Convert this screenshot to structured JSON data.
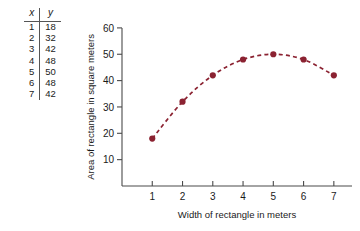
{
  "table": {
    "headers": [
      "x",
      "y"
    ],
    "rows": [
      {
        "x": "1",
        "y": "18"
      },
      {
        "x": "2",
        "y": "32"
      },
      {
        "x": "3",
        "y": "42"
      },
      {
        "x": "4",
        "y": "48"
      },
      {
        "x": "5",
        "y": "50"
      },
      {
        "x": "6",
        "y": "48"
      },
      {
        "x": "7",
        "y": "42"
      }
    ]
  },
  "chart_data": {
    "type": "scatter",
    "title": "",
    "xlabel": "Width of rectangle in meters",
    "ylabel": "Area of rectangle in square meters",
    "x": [
      1,
      2,
      3,
      4,
      5,
      6,
      7
    ],
    "values": [
      18,
      32,
      42,
      48,
      50,
      48,
      42
    ],
    "series": [
      {
        "name": "Area",
        "x": [
          1,
          2,
          3,
          4,
          5,
          6,
          7
        ],
        "values": [
          18,
          32,
          42,
          48,
          50,
          48,
          42
        ],
        "marker_color": "#8B2231",
        "line_color": "#8B2231",
        "line_style": "dashed"
      }
    ],
    "xticks": [
      "1",
      "2",
      "3",
      "4",
      "5",
      "6",
      "7"
    ],
    "xtick_values": [
      1,
      2,
      3,
      4,
      5,
      6,
      7
    ],
    "yticks": [
      "10",
      "20",
      "30",
      "40",
      "50",
      "60"
    ],
    "ytick_values": [
      10,
      20,
      30,
      40,
      50,
      60
    ],
    "xlim": [
      0,
      7.6
    ],
    "ylim": [
      0,
      63
    ],
    "grid": false,
    "legend": false
  },
  "colors": {
    "marker": "#8B2231",
    "line": "#8B2231",
    "axis": "#4a4a4a",
    "text": "#1a1a1a",
    "background": "#ffffff"
  }
}
